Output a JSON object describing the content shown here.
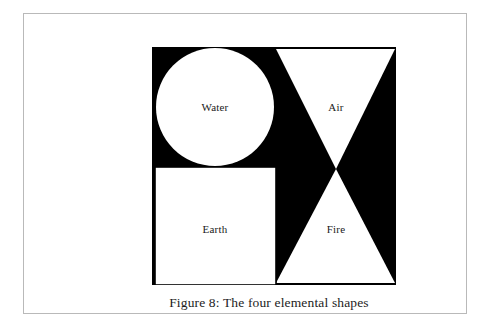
{
  "figure": {
    "caption": "Figure 8: The four elemental shapes",
    "canvas": {
      "background_color": "#000000",
      "shape_fill_color": "#ffffff",
      "outline_color": "#000000",
      "x": 128,
      "y": 33,
      "width": 244,
      "height": 238
    },
    "shapes": [
      {
        "id": "water",
        "label": "Water",
        "form": "circle",
        "fill": "#ffffff",
        "center_x": 63,
        "center_y": 60,
        "radius": 59
      },
      {
        "id": "air",
        "label": "Air",
        "form": "triangle-down",
        "fill": "#ffffff",
        "points": "124,2 243,2 184,122"
      },
      {
        "id": "earth",
        "label": "Earth",
        "form": "square",
        "fill": "#ffffff",
        "x": 3,
        "y": 120,
        "width": 121,
        "height": 118
      },
      {
        "id": "fire",
        "label": "Fire",
        "form": "triangle-up",
        "fill": "#ffffff",
        "points": "124,236 243,236 184,122"
      }
    ]
  },
  "page": {
    "background_color": "#ffffff",
    "frame_color": "#b9b9b9"
  }
}
